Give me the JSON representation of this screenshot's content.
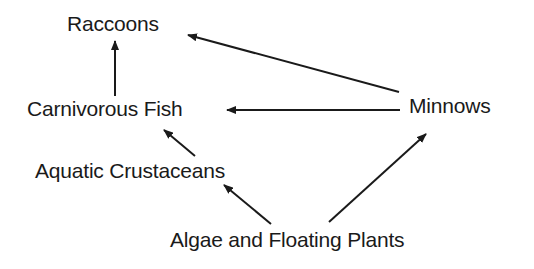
{
  "diagram": {
    "type": "food-web",
    "nodes": [
      {
        "id": "raccoons",
        "label": "Raccoons",
        "x": 67,
        "y": 13
      },
      {
        "id": "carnivorous_fish",
        "label": "Carnivorous Fish",
        "x": 27,
        "y": 98
      },
      {
        "id": "minnows",
        "label": "Minnows",
        "x": 409,
        "y": 95
      },
      {
        "id": "aquatic_crustaceans",
        "label": "Aquatic Crustaceans",
        "x": 35,
        "y": 160
      },
      {
        "id": "algae",
        "label": "Algae and Floating Plants",
        "x": 170,
        "y": 229
      }
    ],
    "edges": [
      {
        "from": "carnivorous_fish",
        "to": "raccoons",
        "x1": 115,
        "y1": 96,
        "x2": 115,
        "y2": 41
      },
      {
        "from": "minnows",
        "to": "raccoons",
        "x1": 399,
        "y1": 92,
        "x2": 188,
        "y2": 35
      },
      {
        "from": "minnows",
        "to": "carnivorous_fish",
        "x1": 400,
        "y1": 110,
        "x2": 227,
        "y2": 110
      },
      {
        "from": "aquatic_crustaceans",
        "to": "carnivorous_fish",
        "x1": 195,
        "y1": 156,
        "x2": 164,
        "y2": 130
      },
      {
        "from": "algae",
        "to": "aquatic_crustaceans",
        "x1": 271,
        "y1": 224,
        "x2": 224,
        "y2": 185
      },
      {
        "from": "algae",
        "to": "minnows",
        "x1": 329,
        "y1": 222,
        "x2": 426,
        "y2": 134
      }
    ],
    "colors": {
      "ink": "#1a1a1a",
      "background": "#ffffff"
    }
  }
}
